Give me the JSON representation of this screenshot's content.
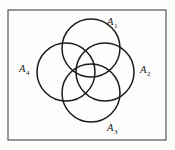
{
  "figure": {
    "kind": "venn-four-circle-rosette",
    "background_color": "#fdfdfc",
    "stroke_color": "#1b1b1b",
    "frame": {
      "label": "bounding rectangle",
      "x": 8,
      "y": 10,
      "width": 158,
      "height": 130,
      "stroke_width": 1.1,
      "stroke_color": "#444444"
    },
    "circles": [
      {
        "id": "A1",
        "position": "top",
        "cx": 91,
        "cy": 48,
        "r": 29
      },
      {
        "id": "A2",
        "position": "right",
        "cx": 105,
        "cy": 72,
        "r": 29
      },
      {
        "id": "A3",
        "position": "bottom",
        "cx": 91,
        "cy": 93,
        "r": 29
      },
      {
        "id": "A4",
        "position": "left",
        "cx": 66,
        "cy": 72,
        "r": 29
      }
    ],
    "circle_stroke_width": 1.5,
    "labels": [
      {
        "id": "A1",
        "base": "A",
        "sub": "1",
        "text": "A1",
        "x": 107,
        "y": 17
      },
      {
        "id": "A2",
        "base": "A",
        "sub": "2",
        "text": "A2",
        "x": 140,
        "y": 65
      },
      {
        "id": "A3",
        "base": "A",
        "sub": "3",
        "text": "A3",
        "x": 107,
        "y": 123
      },
      {
        "id": "A4",
        "base": "A",
        "sub": "4",
        "text": "A4",
        "x": 19,
        "y": 64
      }
    ]
  }
}
